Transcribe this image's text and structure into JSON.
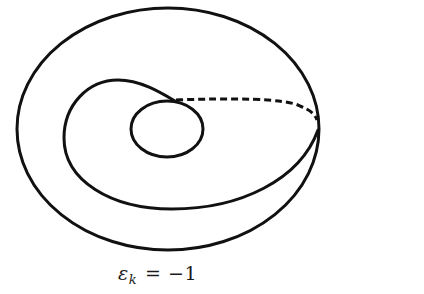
{
  "figure": {
    "caption": {
      "symbol": "ε",
      "subscript": "k",
      "relation": "= −1",
      "full_text": "ε_k = −1"
    },
    "stroke_color": "#111111",
    "background": "#ffffff",
    "shapes": {
      "outer_ellipse": {
        "cx": 168,
        "cy": 129,
        "rx": 151,
        "ry": 121
      },
      "inner_circle": {
        "cx": 167,
        "cy": 129,
        "rx": 36,
        "ry": 28
      },
      "spiral_loop": "solid curve starting at inner-circle top, looping left and around the bottom, meeting the outer ellipse at its right edge",
      "dashed_arc": "dashed curve from inner-circle top to the outer ellipse's right edge"
    }
  }
}
